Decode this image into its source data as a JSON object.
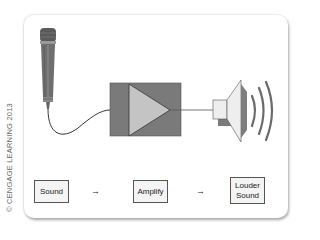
{
  "copyright": "© CENGAGE LEARNING 2013",
  "diagram": {
    "components": [
      {
        "name": "microphone",
        "icon": "microphone-icon"
      },
      {
        "name": "amplifier",
        "icon": "amplifier-triangle-icon"
      },
      {
        "name": "loudspeaker",
        "icon": "speaker-icon"
      }
    ],
    "flow": [
      {
        "label": "Sound"
      },
      {
        "label": "Amplify"
      },
      {
        "label": "Louder Sound",
        "line1": "Louder",
        "line2": "Sound"
      }
    ],
    "arrow_glyph": "→"
  },
  "colors": {
    "amp_box": "#7a7a7a",
    "amp_triangle": "#c4c4c4",
    "mic_body": "#6e6e6e",
    "speaker_cone": "#7d7d7d",
    "speaker_body": "#eeeeee",
    "wire": "#333333"
  }
}
